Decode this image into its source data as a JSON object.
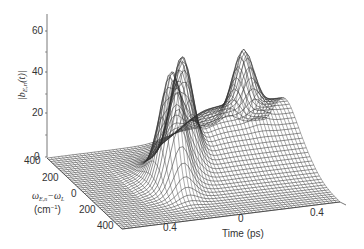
{
  "chart_data": {
    "type": "surface3d",
    "title": "",
    "zlabel": "|b_{E,n}(t)|",
    "xlabel": "Time (ps)",
    "ylabel": "ω_{E,n} − ω_L (cm⁻¹)",
    "ylabel_line1": "ω",
    "ylabel_sub1": "E,n",
    "ylabel_mid": "−ω",
    "ylabel_sub2": "L",
    "ylabel_line2": "(cm",
    "ylabel_sup": "−1",
    "ylabel_close": ")",
    "zlabel_main": "|b",
    "zlabel_sub": "E,n",
    "zlabel_arg": "(t)|",
    "z_ticks": [
      "0",
      "20",
      "40",
      "60"
    ],
    "z_tick_values": [
      0,
      20,
      40,
      60
    ],
    "y_ticks": [
      "400",
      "200",
      "0",
      "200",
      "400"
    ],
    "y_tick_values": [
      -400,
      -200,
      0,
      200,
      400
    ],
    "x_ticks": [
      "0.4",
      "0",
      "0.4"
    ],
    "x_tick_values": [
      -0.4,
      0,
      0.4
    ],
    "zlim": [
      0,
      65
    ],
    "xlim": [
      -0.6,
      0.6
    ],
    "ylim": [
      -400,
      400
    ],
    "grid": false,
    "style": "wireframe mesh, black lines on white",
    "peaks": [
      {
        "time_ps": -0.15,
        "detuning_cm": -60,
        "value": 48
      },
      {
        "time_ps": -0.05,
        "detuning_cm": 40,
        "value": 32
      },
      {
        "time_ps": 0.0,
        "detuning_cm": 100,
        "value": 28
      },
      {
        "time_ps": 0.4,
        "detuning_cm": 250,
        "value": 26
      }
    ]
  }
}
